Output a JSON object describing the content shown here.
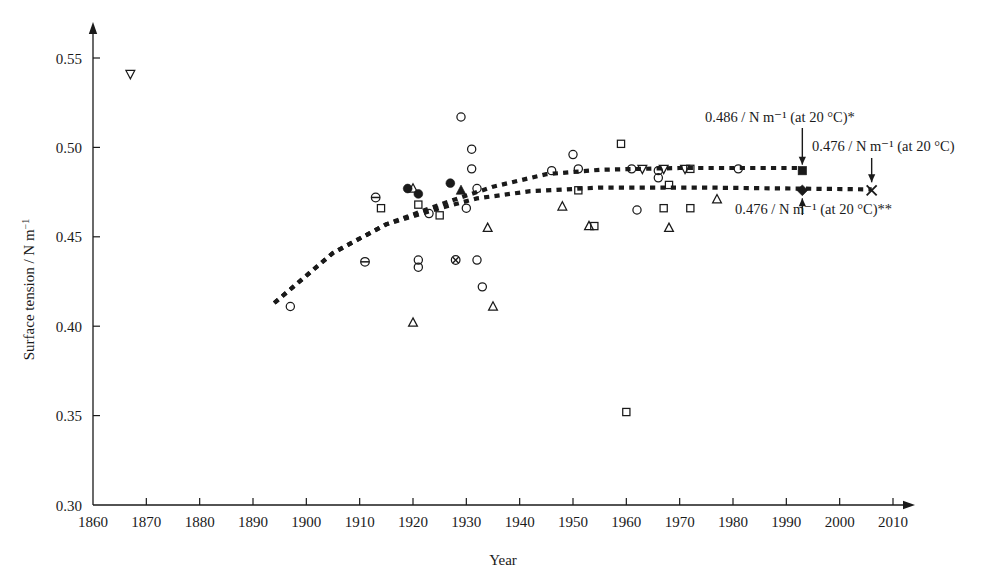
{
  "figure": {
    "kind": "scatter-plot",
    "background": "#ffffff",
    "ink_color": "#1a1a1a"
  },
  "axes": {
    "x": {
      "label": "Year",
      "min": 1860,
      "max": 2010,
      "tick_step": 10,
      "ticks": [
        "1860",
        "1870",
        "1880",
        "1890",
        "1900",
        "1910",
        "1920",
        "1930",
        "1940",
        "1950",
        "1960",
        "1970",
        "1980",
        "1990",
        "2000",
        "2010"
      ],
      "arrow_head": true
    },
    "y": {
      "label_text": "Surface tension / N m",
      "label_sup": "−1",
      "label_full": "Surface tension / N m⁻¹",
      "min": 0.3,
      "max": 0.55,
      "tick_step": 0.05,
      "ticks": [
        "0.55",
        "0.50",
        "0.45",
        "0.40",
        "0.35",
        "0.30"
      ],
      "arrow_head": true
    },
    "grid": false,
    "legend": false
  },
  "annotations": [
    {
      "id": "upper-trend-value",
      "value": "0.486",
      "unit": "/ N m",
      "unit_sup": "−1",
      "condition": "(at 20 °C)",
      "marker_sup": "*",
      "text": "0.486 / N m⁻¹ (at 20 °C)*",
      "arrow": "down",
      "points_to": {
        "year": 1993,
        "value": 0.487
      }
    },
    {
      "id": "cross-endpoint-value",
      "value": "0.476",
      "unit": "/ N m",
      "unit_sup": "−1",
      "condition": "(at 20 °C)",
      "marker_sup": "",
      "text": "0.476 / N m⁻¹ (at 20 °C)",
      "arrow": "down",
      "points_to": {
        "year": 2006,
        "value": 0.476
      }
    },
    {
      "id": "lower-trend-value",
      "value": "0.476",
      "unit": "/ N m",
      "unit_sup": "−1",
      "condition": "(at 20 °C)",
      "marker_sup": "**",
      "text": "0.476 / N m⁻¹ (at 20 °C)**",
      "arrow": "up",
      "points_to": {
        "year": 1993,
        "value": 0.476
      }
    }
  ],
  "chart_data": {
    "type": "scatter",
    "title": "",
    "xlabel": "Year",
    "ylabel": "Surface tension / N m⁻¹",
    "xlim": [
      1860,
      2010
    ],
    "ylim": [
      0.3,
      0.55
    ],
    "grid": false,
    "legend_position": "none",
    "marker_kinds": {
      "open-circle": "open circle",
      "filled-circle": "filled circle",
      "open-square": "open square",
      "filled-square": "filled square",
      "open-up-triangle": "open upward triangle",
      "filled-up-triangle": "filled upward triangle",
      "open-down-triangle": "open downward triangle",
      "circle-bar": "circle with horizontal bar",
      "circle-cross": "circle with cross",
      "cross": "cross / x mark",
      "filled-diamond": "filled diamond"
    },
    "points": [
      {
        "year": 1867,
        "value": 0.541,
        "marker": "open-down-triangle"
      },
      {
        "year": 1897,
        "value": 0.411,
        "marker": "open-circle"
      },
      {
        "year": 1911,
        "value": 0.436,
        "marker": "circle-bar"
      },
      {
        "year": 1913,
        "value": 0.472,
        "marker": "circle-bar"
      },
      {
        "year": 1914,
        "value": 0.466,
        "marker": "open-square"
      },
      {
        "year": 1919,
        "value": 0.477,
        "marker": "filled-circle"
      },
      {
        "year": 1920,
        "value": 0.477,
        "marker": "open-up-triangle"
      },
      {
        "year": 1920,
        "value": 0.402,
        "marker": "open-up-triangle"
      },
      {
        "year": 1921,
        "value": 0.474,
        "marker": "filled-circle"
      },
      {
        "year": 1921,
        "value": 0.468,
        "marker": "open-square"
      },
      {
        "year": 1921,
        "value": 0.437,
        "marker": "open-circle"
      },
      {
        "year": 1921,
        "value": 0.433,
        "marker": "open-circle"
      },
      {
        "year": 1923,
        "value": 0.463,
        "marker": "open-circle"
      },
      {
        "year": 1925,
        "value": 0.462,
        "marker": "open-square"
      },
      {
        "year": 1927,
        "value": 0.48,
        "marker": "filled-circle"
      },
      {
        "year": 1928,
        "value": 0.437,
        "marker": "circle-cross"
      },
      {
        "year": 1929,
        "value": 0.517,
        "marker": "open-circle"
      },
      {
        "year": 1929,
        "value": 0.476,
        "marker": "filled-up-triangle"
      },
      {
        "year": 1930,
        "value": 0.466,
        "marker": "open-circle"
      },
      {
        "year": 1931,
        "value": 0.499,
        "marker": "open-circle"
      },
      {
        "year": 1931,
        "value": 0.488,
        "marker": "open-circle"
      },
      {
        "year": 1932,
        "value": 0.477,
        "marker": "open-circle"
      },
      {
        "year": 1932,
        "value": 0.437,
        "marker": "open-circle"
      },
      {
        "year": 1933,
        "value": 0.422,
        "marker": "open-circle"
      },
      {
        "year": 1934,
        "value": 0.455,
        "marker": "open-up-triangle"
      },
      {
        "year": 1935,
        "value": 0.411,
        "marker": "open-up-triangle"
      },
      {
        "year": 1946,
        "value": 0.487,
        "marker": "open-circle"
      },
      {
        "year": 1948,
        "value": 0.467,
        "marker": "open-up-triangle"
      },
      {
        "year": 1950,
        "value": 0.496,
        "marker": "open-circle"
      },
      {
        "year": 1951,
        "value": 0.488,
        "marker": "open-circle"
      },
      {
        "year": 1951,
        "value": 0.476,
        "marker": "open-square"
      },
      {
        "year": 1953,
        "value": 0.456,
        "marker": "open-up-triangle"
      },
      {
        "year": 1954,
        "value": 0.456,
        "marker": "open-square"
      },
      {
        "year": 1959,
        "value": 0.502,
        "marker": "open-square"
      },
      {
        "year": 1960,
        "value": 0.352,
        "marker": "open-square"
      },
      {
        "year": 1961,
        "value": 0.488,
        "marker": "open-circle"
      },
      {
        "year": 1962,
        "value": 0.465,
        "marker": "open-circle"
      },
      {
        "year": 1963,
        "value": 0.488,
        "marker": "open-down-triangle"
      },
      {
        "year": 1966,
        "value": 0.487,
        "marker": "open-circle"
      },
      {
        "year": 1966,
        "value": 0.483,
        "marker": "open-circle"
      },
      {
        "year": 1967,
        "value": 0.488,
        "marker": "open-down-triangle"
      },
      {
        "year": 1967,
        "value": 0.466,
        "marker": "open-square"
      },
      {
        "year": 1968,
        "value": 0.479,
        "marker": "open-square"
      },
      {
        "year": 1968,
        "value": 0.455,
        "marker": "open-up-triangle"
      },
      {
        "year": 1971,
        "value": 0.488,
        "marker": "open-down-triangle"
      },
      {
        "year": 1972,
        "value": 0.488,
        "marker": "open-square"
      },
      {
        "year": 1972,
        "value": 0.466,
        "marker": "open-square"
      },
      {
        "year": 1977,
        "value": 0.471,
        "marker": "open-up-triangle"
      },
      {
        "year": 1981,
        "value": 0.488,
        "marker": "open-circle"
      },
      {
        "year": 1993,
        "value": 0.487,
        "marker": "filled-square"
      },
      {
        "year": 1993,
        "value": 0.476,
        "marker": "filled-diamond"
      },
      {
        "year": 2006,
        "value": 0.476,
        "marker": "cross"
      }
    ],
    "trend_lines": [
      {
        "id": "upper-dashed-trend",
        "style": "dotted-thick",
        "label": "upper trend to 0.486 N m-1",
        "path": [
          {
            "year": 1894,
            "value": 0.413
          },
          {
            "year": 1905,
            "value": 0.441
          },
          {
            "year": 1915,
            "value": 0.457
          },
          {
            "year": 1925,
            "value": 0.468
          },
          {
            "year": 1935,
            "value": 0.478
          },
          {
            "year": 1945,
            "value": 0.485
          },
          {
            "year": 1955,
            "value": 0.4875
          },
          {
            "year": 1970,
            "value": 0.4885
          },
          {
            "year": 1993,
            "value": 0.4885
          }
        ]
      },
      {
        "id": "lower-dashed-trend",
        "style": "dotted-thick",
        "label": "lower trend to 0.476 N m-1",
        "path": [
          {
            "year": 1894,
            "value": 0.413
          },
          {
            "year": 1905,
            "value": 0.441
          },
          {
            "year": 1915,
            "value": 0.457
          },
          {
            "year": 1925,
            "value": 0.466
          },
          {
            "year": 1932,
            "value": 0.4715
          },
          {
            "year": 1942,
            "value": 0.4755
          },
          {
            "year": 1955,
            "value": 0.4775
          },
          {
            "year": 1975,
            "value": 0.4775
          },
          {
            "year": 2006,
            "value": 0.4765
          }
        ]
      }
    ]
  }
}
